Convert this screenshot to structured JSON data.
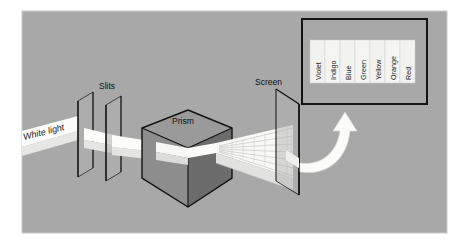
{
  "figure": {
    "canvas": {
      "width": 453,
      "height": 247
    },
    "background_color": "#ffffff",
    "panel_color": "#a8a8a8",
    "panel_border_color": "#d0d0d0"
  },
  "labels": {
    "white_light": "White light",
    "slits": "Slits",
    "prism": "Prism",
    "screen": "Screen"
  },
  "spectrum_box": {
    "border_color": "#1a1a1a",
    "fill_color": "#a8a8a8",
    "bands": [
      {
        "name": "Violet",
        "swatch": "#f2f2f0"
      },
      {
        "name": "Indigo",
        "swatch": "#f4f4f2"
      },
      {
        "name": "Blue",
        "swatch": "#f2f2f0"
      },
      {
        "name": "Green",
        "swatch": "#f4f4f2"
      },
      {
        "name": "Yellow",
        "swatch": "#f2f2f0"
      },
      {
        "name": "Orange",
        "swatch": "#f4f4f2"
      },
      {
        "name": "Red",
        "swatch": "#f2f2f0"
      }
    ]
  },
  "elements": {
    "beam_color": "#fcfcfa",
    "prism_front_color": "#6e6e6e",
    "prism_left_color": "#8f8f8f",
    "prism_top_color": "#9c9c9c",
    "slit_plate_color": "#b4b4b4",
    "screen_plate_color": "#b0b0b0",
    "outline_color": "#111111",
    "arrow_color": "#fbfbf9"
  }
}
